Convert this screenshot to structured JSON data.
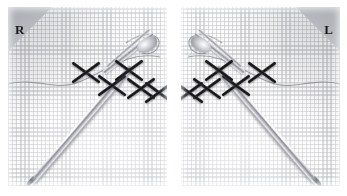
{
  "figure": {
    "kind": "stereo-pair-photograph",
    "panel_count": 2,
    "background_color": "#ffffff"
  },
  "panels": [
    {
      "id": "right-eye",
      "corner_marker": {
        "label": "R",
        "shape": "triangle",
        "position": "top-left",
        "color": "#b4b6bb"
      },
      "fabric": {
        "type": "aida-weave-grid",
        "base_color": "#fafafa",
        "thread_color": "#bcbec2",
        "grid_pitch_px": 4
      },
      "stitches": {
        "type": "cross-stitch",
        "color": "#111113",
        "count": 5,
        "positions": [
          {
            "x": 78,
            "y": 66
          },
          {
            "x": 104,
            "y": 79
          },
          {
            "x": 121,
            "y": 64
          },
          {
            "x": 133,
            "y": 82
          },
          {
            "x": 151,
            "y": 86
          }
        ]
      },
      "instrument": {
        "name": "needle-holder",
        "material_color": "#b9bbc0",
        "orientation": "diagonal-lower-left-to-upper-right",
        "tip_position": {
          "x": 22,
          "y": 178
        },
        "jaw_position": {
          "x": 140,
          "y": 34
        }
      },
      "floss_trail": {
        "color": "#8e9096",
        "from": {
          "x": 8,
          "y": 76
        },
        "to": {
          "x": 152,
          "y": 52
        }
      }
    },
    {
      "id": "left-eye",
      "corner_marker": {
        "label": "L",
        "shape": "triangle",
        "position": "top-right",
        "color": "#b4b6bb"
      },
      "fabric": {
        "type": "aida-weave-grid",
        "base_color": "#fafafa",
        "thread_color": "#bcbec2",
        "grid_pitch_px": 4
      },
      "stitches": {
        "type": "cross-stitch",
        "color": "#111113",
        "count": 5,
        "positions": [
          {
            "x": 81,
            "y": 66
          },
          {
            "x": 55,
            "y": 79
          },
          {
            "x": 38,
            "y": 64
          },
          {
            "x": 26,
            "y": 82
          },
          {
            "x": 8,
            "y": 86
          }
        ]
      },
      "instrument": {
        "name": "needle-holder",
        "material_color": "#b9bbc0",
        "orientation": "diagonal-lower-right-to-upper-left",
        "tip_position": {
          "x": 137,
          "y": 178
        },
        "jaw_position": {
          "x": 19,
          "y": 34
        }
      },
      "floss_trail": {
        "color": "#8e9096",
        "from": {
          "x": 151,
          "y": 76
        },
        "to": {
          "x": 7,
          "y": 52
        }
      }
    }
  ]
}
